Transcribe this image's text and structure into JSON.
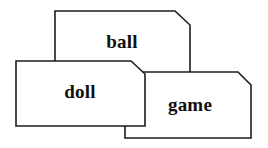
{
  "figure": {
    "type": "diagram",
    "background_color": "#ffffff",
    "line_color": "#1d1d1d",
    "text_color": "#101010",
    "width": 268,
    "height": 148
  },
  "cards": [
    {
      "id": "ball",
      "label": "ball",
      "stack_order": "back",
      "points": "55,11 175,11 190,25 190,77 55,77",
      "label_x": 122,
      "label_y": 44
    },
    {
      "id": "game",
      "label": "game",
      "stack_order": "middle",
      "points": "125,72 238,72 251,85 251,138 125,138",
      "label_x": 190,
      "label_y": 107
    },
    {
      "id": "doll",
      "label": "doll",
      "stack_order": "front",
      "points": "16,61 131,61 145,74 145,126 16,126",
      "label_x": 80,
      "label_y": 94
    }
  ]
}
